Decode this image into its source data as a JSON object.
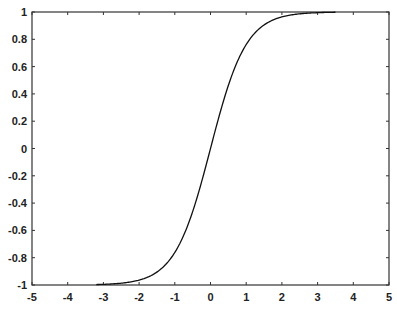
{
  "chart_data": {
    "type": "line",
    "title": "",
    "xlabel": "",
    "ylabel": "",
    "xlim": [
      -5,
      5
    ],
    "ylim": [
      -1,
      1
    ],
    "grid": false,
    "legend": null,
    "x_ticks": [
      "-5",
      "-4",
      "-3",
      "-2",
      "-1",
      "0",
      "1",
      "2",
      "3",
      "4",
      "5"
    ],
    "y_ticks": [
      "-1",
      "-0.8",
      "-0.6",
      "-0.4",
      "-0.2",
      "0",
      "0.2",
      "0.4",
      "0.6",
      "0.8",
      "1"
    ],
    "series": [
      {
        "name": "tanh(x)",
        "color": "#111111",
        "x": [
          -3.2,
          -3.0,
          -2.5,
          -2.0,
          -1.5,
          -1.0,
          -0.5,
          0.0,
          0.5,
          1.0,
          1.5,
          2.0,
          2.5,
          3.0,
          3.5
        ],
        "y": [
          -0.997,
          -0.995,
          -0.987,
          -0.964,
          -0.905,
          -0.762,
          -0.462,
          0.0,
          0.462,
          0.762,
          0.905,
          0.964,
          0.987,
          0.995,
          0.998
        ]
      }
    ]
  },
  "style": {
    "axis_color": "#333333",
    "background": "#ffffff"
  }
}
